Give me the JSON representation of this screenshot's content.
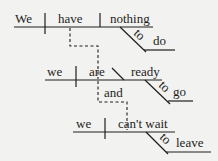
{
  "diagram": {
    "type": "sentence-diagram (Reed-Kellogg)",
    "clauses": [
      {
        "subject": "We",
        "verb": "have",
        "object": "nothing",
        "modifier": {
          "particle": "to",
          "word": "do"
        }
      },
      {
        "subject": "we",
        "verb": "are",
        "complement": "ready",
        "modifier": {
          "particle": "to",
          "word": "go"
        }
      },
      {
        "subject": "we",
        "verb": "can't wait",
        "modifier": {
          "particle": "to",
          "word": "leave"
        }
      }
    ],
    "conjunction": "and",
    "colors": {
      "ink": "#1e1e1e",
      "background": "#f2f2f0"
    }
  }
}
